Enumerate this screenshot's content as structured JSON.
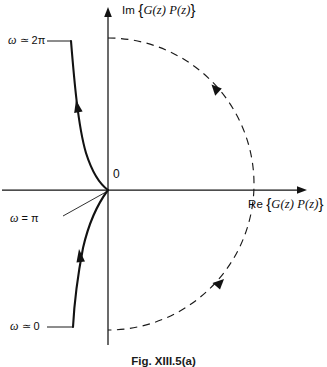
{
  "figure": {
    "caption": "Fig. XIII.5(a)",
    "background_color": "#ffffff",
    "stroke_color": "#121212"
  },
  "axes": {
    "imaginary_axis_label_prefix": "Im",
    "imaginary_axis_label": "Im {G(z) P(z)}",
    "real_axis_label_prefix": "Re",
    "real_axis_label": "Re {G(z) P(z)}",
    "function_expression": "G(z) P(z)",
    "origin_label": "0",
    "bracket_open": "{",
    "bracket_close": "}"
  },
  "annotations": {
    "omega_2pi": "ω ≃ 2π",
    "omega_pi": "ω = π",
    "omega_0": "ω ≃ 0"
  },
  "chart_data": {
    "type": "line",
    "title": "Fig. XIII.5(a)",
    "xlabel": "Re {G(z) P(z)}",
    "ylabel": "Im {G(z) P(z)}",
    "grid": false,
    "legend": "none",
    "xlim": [
      -0.3,
      1.45
    ],
    "ylim": [
      -1.25,
      1.25
    ],
    "origin_px": [
      108,
      190
    ],
    "series": [
      {
        "name": "Nyquist contour image (solid, finite frequency)",
        "style": "solid",
        "direction": "upward (increasing ω from 0 to 2π)",
        "points_px": [
          [
            71,
            41
          ],
          [
            74,
            70
          ],
          [
            78,
            108
          ],
          [
            83,
            140
          ],
          [
            93,
            168
          ],
          [
            103,
            184
          ],
          [
            108,
            190
          ],
          [
            101,
            200
          ],
          [
            92,
            214
          ],
          [
            85,
            236
          ],
          [
            80,
            258
          ],
          [
            77,
            288
          ],
          [
            74,
            312
          ],
          [
            73,
            327
          ]
        ]
      },
      {
        "name": "Large-radius closure arc (dashed)",
        "style": "dashed",
        "direction": "clockwise",
        "center_px": [
          108,
          184
        ],
        "radius_px": 146,
        "start_angle_deg": -90,
        "end_angle_deg": 90
      }
    ],
    "arrows": [
      {
        "name": "solid-upper-arrow",
        "at_px": [
          78,
          109
        ],
        "heading_deg": -100
      },
      {
        "name": "solid-lower-arrow",
        "at_px": [
          80,
          259
        ],
        "heading_deg": -100
      },
      {
        "name": "dashed-upper-arrow",
        "at_px": [
          217,
          89
        ],
        "heading_deg": 220
      },
      {
        "name": "dashed-lower-arrow",
        "at_px": [
          218,
          285
        ],
        "heading_deg": 40
      }
    ],
    "annotation_points": [
      {
        "label": "ω ≃ 2π",
        "at_px": [
          71,
          41
        ]
      },
      {
        "label": "ω = π",
        "at_px": [
          108,
          190
        ]
      },
      {
        "label": "ω ≃ 0",
        "at_px": [
          73,
          327
        ]
      }
    ]
  }
}
